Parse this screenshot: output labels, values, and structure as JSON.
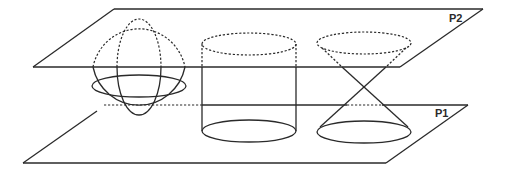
{
  "diagram": {
    "planes": [
      {
        "id": "p2",
        "label": "P2"
      },
      {
        "id": "p1",
        "label": "P1"
      }
    ],
    "solids": [
      {
        "id": "sphere",
        "name": "Sphere"
      },
      {
        "id": "cylinder",
        "name": "Cylinder"
      },
      {
        "id": "double-cone",
        "name": "Double cone"
      }
    ],
    "colors": {
      "stroke": "#2a2a2a",
      "background": "#ffffff"
    }
  }
}
